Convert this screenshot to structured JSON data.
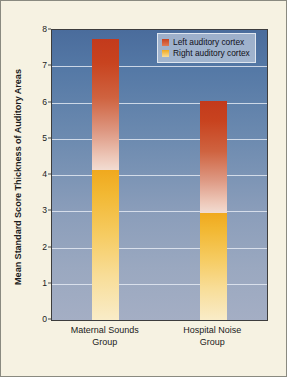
{
  "chart_data": {
    "type": "bar",
    "stacked": true,
    "title": "",
    "xlabel": "",
    "ylabel": "Mean Standard Score Thickness of Auditory Areas",
    "ylim": [
      0,
      8
    ],
    "yticks": [
      0,
      1,
      2,
      3,
      4,
      5,
      6,
      7,
      8
    ],
    "ytick_labels": [
      "0",
      "1",
      "2",
      "3",
      "4",
      "5",
      "6",
      "7",
      "8"
    ],
    "grid": true,
    "grid_axis": "y",
    "categories": [
      "Maternal Sounds Group",
      "Hospital Noise Group"
    ],
    "category_lines": [
      [
        "Maternal Sounds",
        "Group"
      ],
      [
        "Hospital Noise",
        "Group"
      ]
    ],
    "series": [
      {
        "name": "Right auditory cortex",
        "color": "#f0a91e",
        "values": [
          4.15,
          2.95
        ]
      },
      {
        "name": "Left auditory cortex",
        "color": "#c8431f",
        "values": [
          3.6,
          3.1
        ]
      }
    ],
    "bar_totals": [
      7.75,
      6.05
    ],
    "legend": {
      "position": "top-right-inside",
      "entries": [
        {
          "label": "Left auditory cortex",
          "color": "#c8431f",
          "swatch": "left-cortex-swatch"
        },
        {
          "label": "Right auditory cortex",
          "color": "#f0a91e",
          "swatch": "right-cortex-swatch"
        }
      ]
    },
    "colors": {
      "plot_background_top": "#4a6c9c",
      "plot_background_bottom": "#a4aec4",
      "figure_background": "#f6f2e2",
      "gridline": "#e8eef6",
      "axis": "#3d3d3d",
      "text": "#1b1b1b"
    }
  }
}
